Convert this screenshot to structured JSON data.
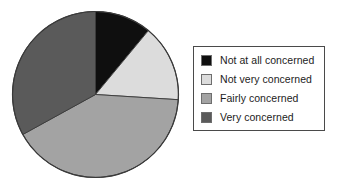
{
  "chart_data": {
    "type": "pie",
    "title": "",
    "subtitle": "",
    "xlabel": "",
    "ylabel": "",
    "grid": false,
    "legend_position": "right",
    "start_angle_deg": 0,
    "direction": "clockwise",
    "categories": [
      "Not at all concerned",
      "Not very concerned",
      "Fairly concerned",
      "Very concerned"
    ],
    "values": [
      11,
      15,
      41,
      33
    ],
    "value_unit": "percent",
    "slices": [
      {
        "label": "Not at all concerned",
        "value": 11,
        "start_angle_deg": 0,
        "end_angle_deg": 39.6,
        "color": "#0f0f0f"
      },
      {
        "label": "Not very concerned",
        "value": 15,
        "start_angle_deg": 39.6,
        "end_angle_deg": 93.6,
        "color": "#dcdcdc"
      },
      {
        "label": "Fairly concerned",
        "value": 41,
        "start_angle_deg": 93.6,
        "end_angle_deg": 241.2,
        "color": "#a3a3a3"
      },
      {
        "label": "Very concerned",
        "value": 33,
        "start_angle_deg": 241.2,
        "end_angle_deg": 360,
        "color": "#5a5a5a"
      }
    ]
  },
  "legend": {
    "items": [
      {
        "label": "Not at all concerned",
        "swatch_name": "legend-swatch-not-at-all-concerned",
        "color": "#0f0f0f"
      },
      {
        "label": "Not very concerned",
        "swatch_name": "legend-swatch-not-very-concerned",
        "color": "#dcdcdc"
      },
      {
        "label": "Fairly concerned",
        "swatch_name": "legend-swatch-fairly-concerned",
        "color": "#a3a3a3"
      },
      {
        "label": "Very concerned",
        "swatch_name": "legend-swatch-very-concerned",
        "color": "#5a5a5a"
      }
    ]
  },
  "colors": {
    "not_at_all_concerned": "#0f0f0f",
    "not_very_concerned": "#dcdcdc",
    "fairly_concerned": "#a3a3a3",
    "very_concerned": "#5a5a5a",
    "outline": "#3a3a3a",
    "legend_border": "#4a4a4a",
    "background": "#ffffff"
  }
}
